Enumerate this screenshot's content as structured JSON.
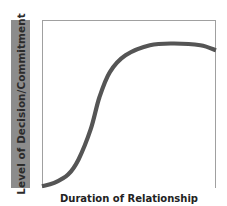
{
  "chart_data": {
    "type": "line",
    "title": "",
    "xlabel": "Duration of Relationship",
    "ylabel": "Level of Decision/Commitment",
    "xlim": [
      0,
      100
    ],
    "ylim": [
      0,
      100
    ],
    "grid": false,
    "ticks": false,
    "legend": null,
    "series": [
      {
        "name": "Decision/Commitment",
        "x": [
          0,
          7,
          15,
          21,
          28,
          33,
          39,
          48,
          62,
          76,
          91,
          100
        ],
        "values": [
          1,
          3,
          8,
          17,
          35,
          54,
          69,
          79,
          85,
          86,
          85,
          82
        ],
        "color": "#555555"
      }
    ],
    "note": "Unlabeled axes; values are normalized (0-100) estimates of an S-shaped curve that plateaus and dips slightly at the end."
  },
  "colors": {
    "ylabel_box": "#8c8c8c",
    "ylabel_text": "#2b2b2b",
    "axis_frame": "#9a9a9a",
    "curve": "#555555",
    "xlabel_text": "#222222"
  },
  "labels": {
    "x_axis": "Duration of Relationship",
    "y_axis": "Level of Decision/Commitment"
  }
}
